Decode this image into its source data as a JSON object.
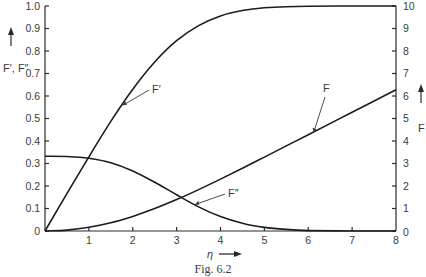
{
  "chart_data": {
    "type": "line",
    "title": "",
    "caption": "Fig. 6.2",
    "xlabel": "η",
    "ylabel_left": "F′, F″",
    "ylabel_right": "F",
    "xlim": [
      0,
      8
    ],
    "ylim_left": [
      0,
      1.0
    ],
    "ylim_right": [
      0,
      10
    ],
    "grid": false,
    "legend": "inline annotations with leader lines",
    "x_ticks": [
      "1",
      "2",
      "3",
      "4",
      "5",
      "6",
      "7",
      "8"
    ],
    "left_ticks": [
      "0",
      "0.1",
      "0.2",
      "0.3",
      "0.4",
      "0.5",
      "0.6",
      "0.7",
      "0.8",
      "0.9",
      "1.0"
    ],
    "right_ticks": [
      "0",
      "1",
      "2",
      "3",
      "4",
      "5",
      "6",
      "7",
      "8",
      "9",
      "10"
    ],
    "x": [
      0,
      0.5,
      1,
      1.5,
      2,
      2.5,
      3,
      3.5,
      4,
      4.5,
      5,
      5.5,
      6,
      7,
      8
    ],
    "series": [
      {
        "name": "F′",
        "axis": "left",
        "values": [
          0,
          0.166,
          0.33,
          0.487,
          0.63,
          0.751,
          0.846,
          0.913,
          0.956,
          0.98,
          0.992,
          0.997,
          0.999,
          1.0,
          1.0
        ]
      },
      {
        "name": "F″",
        "axis": "left",
        "values": [
          0.332,
          0.331,
          0.323,
          0.303,
          0.267,
          0.217,
          0.161,
          0.107,
          0.064,
          0.034,
          0.016,
          0.007,
          0.002,
          0.0,
          0.0
        ]
      },
      {
        "name": "F",
        "axis": "right",
        "values": [
          0,
          0.042,
          0.166,
          0.37,
          0.65,
          0.996,
          1.397,
          1.838,
          2.306,
          2.79,
          3.283,
          3.781,
          4.28,
          5.279,
          6.279
        ]
      }
    ],
    "annotations": [
      {
        "label": "F′",
        "target_x": 1.75,
        "series": "F′"
      },
      {
        "label": "F″",
        "target_x": 3.4,
        "series": "F″"
      },
      {
        "label": "F",
        "target_x": 6.1,
        "series": "F"
      }
    ]
  },
  "labels": {
    "left_axis": "F′, F″",
    "right_axis": "F",
    "x_axis": "η",
    "caption": "Fig. 6.2",
    "ann_fprime": "F′",
    "ann_fdoubleprime": "F″",
    "ann_f": "F"
  }
}
